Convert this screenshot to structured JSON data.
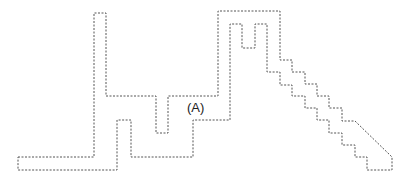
{
  "diagram": {
    "type": "dashed-outline-region",
    "stroke_color": "#555555",
    "background": "#ffffff",
    "label": {
      "text": "(A)",
      "x": 187,
      "y": 101
    },
    "outline_points": [
      [
        18,
        157
      ],
      [
        94,
        157
      ],
      [
        94,
        13
      ],
      [
        106,
        13
      ],
      [
        106,
        96
      ],
      [
        156,
        96
      ],
      [
        156,
        133
      ],
      [
        168,
        133
      ],
      [
        168,
        96
      ],
      [
        218,
        96
      ],
      [
        218,
        11
      ],
      [
        280,
        11
      ],
      [
        280,
        60
      ],
      [
        292,
        60
      ],
      [
        292,
        72
      ],
      [
        305,
        72
      ],
      [
        305,
        84
      ],
      [
        317,
        84
      ],
      [
        317,
        96
      ],
      [
        329,
        96
      ],
      [
        329,
        108
      ],
      [
        342,
        108
      ],
      [
        342,
        121
      ],
      [
        355,
        121
      ],
      [
        392,
        157
      ],
      [
        392,
        170
      ],
      [
        367,
        170
      ],
      [
        367,
        157
      ],
      [
        355,
        157
      ],
      [
        355,
        145
      ],
      [
        342,
        145
      ],
      [
        342,
        133
      ],
      [
        329,
        133
      ],
      [
        329,
        120
      ],
      [
        317,
        120
      ],
      [
        317,
        108
      ],
      [
        305,
        108
      ],
      [
        305,
        96
      ],
      [
        292,
        96
      ],
      [
        292,
        85
      ],
      [
        280,
        85
      ],
      [
        280,
        72
      ],
      [
        267,
        72
      ],
      [
        267,
        24
      ],
      [
        255,
        24
      ],
      [
        255,
        48
      ],
      [
        242,
        48
      ],
      [
        242,
        24
      ],
      [
        230,
        24
      ],
      [
        230,
        120
      ],
      [
        193,
        120
      ],
      [
        193,
        157
      ],
      [
        131,
        157
      ],
      [
        131,
        120
      ],
      [
        117,
        120
      ],
      [
        117,
        170
      ],
      [
        18,
        170
      ]
    ]
  }
}
